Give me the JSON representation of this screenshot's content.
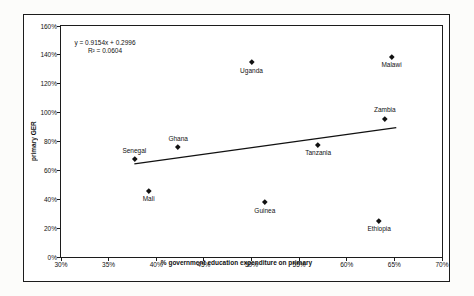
{
  "chart_data": {
    "type": "scatter",
    "title": "",
    "xlabel": "% government education expenditure on primary",
    "ylabel": "primary GER",
    "xlim": [
      30,
      70
    ],
    "ylim": [
      0,
      160
    ],
    "x_ticks": [
      30,
      35,
      40,
      45,
      50,
      55,
      60,
      65,
      70
    ],
    "y_ticks": [
      0,
      20,
      40,
      60,
      80,
      100,
      120,
      140,
      160
    ],
    "tick_suffix": "%",
    "grid": false,
    "legend": "none",
    "marker_shape": "diamond",
    "points": [
      {
        "label": "Senegal",
        "x": 37.7,
        "y": 68,
        "label_position": "above"
      },
      {
        "label": "Mali",
        "x": 39.2,
        "y": 46,
        "label_position": "below"
      },
      {
        "label": "Ghana",
        "x": 42.3,
        "y": 76,
        "label_position": "above"
      },
      {
        "label": "Uganda",
        "x": 50.0,
        "y": 135,
        "label_position": "below"
      },
      {
        "label": "Guinea",
        "x": 51.4,
        "y": 38,
        "label_position": "below"
      },
      {
        "label": "Tanzania",
        "x": 57.0,
        "y": 78,
        "label_position": "below"
      },
      {
        "label": "Ethiopia",
        "x": 63.4,
        "y": 25,
        "label_position": "below"
      },
      {
        "label": "Zambia",
        "x": 64.0,
        "y": 96,
        "label_position": "above"
      },
      {
        "label": "Malawi",
        "x": 64.7,
        "y": 139,
        "label_position": "below"
      }
    ],
    "trendline": {
      "x1": 37.7,
      "y1": 64.5,
      "x2": 65.2,
      "y2": 89.6,
      "equation": "y = 0.9154x + 0.2996",
      "r2_label": "R² = 0.0604"
    },
    "colors": {
      "marker": "#111111",
      "trendline": "#111111",
      "text": "#111111",
      "plot_background": "#ffffff",
      "page_background": "#fcfcfa",
      "border": "#1c1c1c"
    }
  }
}
